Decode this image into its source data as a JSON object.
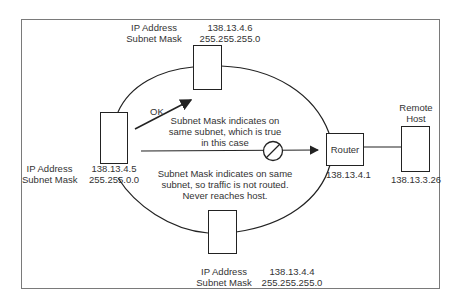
{
  "diagram": {
    "hosts": {
      "top": {
        "ip_label": "IP Address",
        "mask_label": "Subnet Mask",
        "ip": "138.13.4.6",
        "mask": "255.255.255.0"
      },
      "left": {
        "ip_label": "IP Address",
        "mask_label": "Subnet Mask",
        "ip": "138.13.4.5",
        "mask": "255.255.0.0"
      },
      "bottom": {
        "ip_label": "IP Address",
        "mask_label": "Subnet Mask",
        "ip": "138.13.4.4",
        "mask": "255.255.255.0"
      }
    },
    "router": {
      "label": "Router",
      "ip": "138.13.4.1"
    },
    "remote_host": {
      "label_line1": "Remote",
      "label_line2": "Host",
      "ip": "138.13.3.26"
    },
    "annotations": {
      "ok": "OK",
      "same_subnet_1": "Subnet Mask indicates on",
      "same_subnet_2": "same subnet, which is true",
      "same_subnet_3": "in this case",
      "not_routed_1": "Subnet Mask indicates on same",
      "not_routed_2": "subnet, so traffic is not routed.",
      "not_routed_3": "Never reaches host."
    },
    "icons": {
      "blocked": "no-entry-circle-slash",
      "arrow": "arrowhead"
    },
    "colors": {
      "line": "#222222",
      "frame": "#7a7a7a",
      "text": "#333333"
    }
  }
}
